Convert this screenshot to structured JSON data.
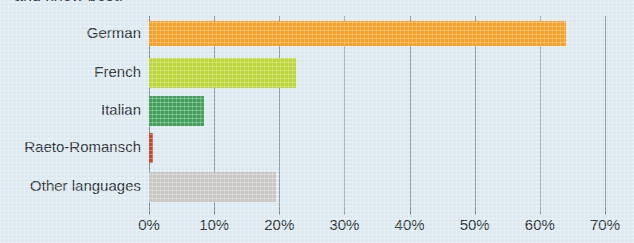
{
  "caption": {
    "clipped_line": "and know best."
  },
  "chart_data": {
    "type": "bar",
    "orientation": "horizontal",
    "title": "",
    "subtitle": "",
    "xlabel": "",
    "ylabel": "",
    "categories": [
      "German",
      "French",
      "Italian",
      "Raeto-Romansch",
      "Other languages"
    ],
    "values": [
      64,
      22.5,
      8.5,
      0.6,
      19.5
    ],
    "value_suffix": "%",
    "xlim": [
      0,
      70
    ],
    "xticks": [
      0,
      10,
      20,
      30,
      40,
      50,
      60,
      70
    ],
    "xtick_labels": [
      "0%",
      "10%",
      "20%",
      "30%",
      "40%",
      "50%",
      "60%",
      "70%"
    ],
    "grid": true,
    "legend": false,
    "bar_colors": [
      "#f5a028",
      "#bdd63a",
      "#43a05c",
      "#c8442c",
      "#c9c6c3"
    ],
    "series": [
      {
        "name": "Share of population",
        "values": [
          64,
          22.5,
          8.5,
          0.6,
          19.5
        ]
      }
    ]
  },
  "colors": {
    "background": "#dce9f0",
    "gridline": "#8c9aa3",
    "text": "#2d3337"
  }
}
